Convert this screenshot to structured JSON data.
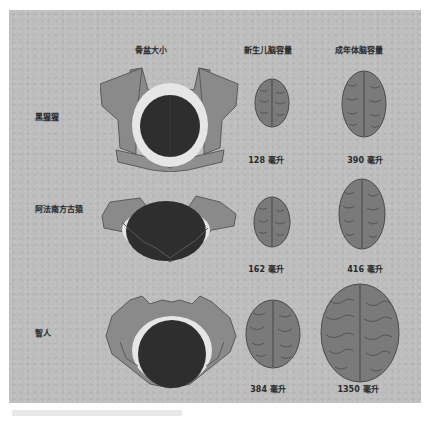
{
  "headers": {
    "pelvis": "骨盆大小",
    "newborn": "新生儿脑容量",
    "adult": "成年体脑容量"
  },
  "rows": [
    {
      "species": "黑猩猩",
      "newborn_volume": "128 毫升",
      "adult_volume": "390 毫升"
    },
    {
      "species": "阿法南方古猿",
      "newborn_volume": "162 毫升",
      "adult_volume": "416 毫升"
    },
    {
      "species": "智人",
      "newborn_volume": "384 毫升",
      "adult_volume": "1350 毫升"
    }
  ],
  "colors": {
    "panel_background": "#bdbdbd",
    "pelvis_bone": "#8a8a8a",
    "pelvis_outline": "#5a5a5a",
    "birth_canal_gap": "#e6e6e6",
    "infant_head": "#2e2e2e",
    "brain_fill": "#7a7a7a",
    "brain_sulci": "#4a4a4a",
    "text": "#2a2a2a"
  }
}
